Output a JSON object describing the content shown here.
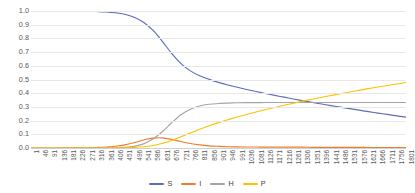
{
  "chart_data": {
    "type": "line",
    "title": "",
    "xlabel": "",
    "ylabel": "",
    "ylim": [
      0.0,
      1.0
    ],
    "ytick_labels": [
      "1.0",
      "0.9",
      "0.8",
      "0.7",
      "0.6",
      "0.5",
      "0.4",
      "0.3",
      "0.2",
      "0.1",
      "0.0"
    ],
    "ytick_values": [
      1.0,
      0.9,
      0.8,
      0.7,
      0.6,
      0.5,
      0.4,
      0.3,
      0.2,
      0.1,
      0.0
    ],
    "grid": true,
    "legend_position": "bottom",
    "xlim": [
      1,
      1801
    ],
    "x_tick_step": 45,
    "categories": [
      1,
      46,
      91,
      136,
      181,
      226,
      271,
      316,
      361,
      406,
      451,
      496,
      541,
      586,
      631,
      676,
      721,
      766,
      811,
      856,
      901,
      946,
      991,
      1036,
      1081,
      1126,
      1171,
      1216,
      1261,
      1306,
      1351,
      1396,
      1441,
      1486,
      1531,
      1576,
      1621,
      1666,
      1711,
      1756,
      1801
    ],
    "series": [
      {
        "name": "S",
        "color": "#5B6DB8",
        "values": [
          1.0,
          1.0,
          1.0,
          1.0,
          0.999,
          0.999,
          0.998,
          0.996,
          0.993,
          0.987,
          0.976,
          0.955,
          0.918,
          0.86,
          0.779,
          0.691,
          0.616,
          0.563,
          0.527,
          0.501,
          0.479,
          0.46,
          0.443,
          0.427,
          0.412,
          0.398,
          0.384,
          0.371,
          0.358,
          0.345,
          0.333,
          0.321,
          0.309,
          0.298,
          0.287,
          0.276,
          0.265,
          0.255,
          0.245,
          0.235,
          0.225
        ]
      },
      {
        "name": "I",
        "color": "#ED7D31",
        "values": [
          0.0,
          0.0,
          0.0,
          0.0,
          0.001,
          0.001,
          0.002,
          0.004,
          0.007,
          0.013,
          0.023,
          0.039,
          0.058,
          0.072,
          0.074,
          0.063,
          0.047,
          0.033,
          0.023,
          0.016,
          0.012,
          0.009,
          0.008,
          0.007,
          0.007,
          0.006,
          0.006,
          0.006,
          0.006,
          0.006,
          0.005,
          0.005,
          0.005,
          0.005,
          0.005,
          0.005,
          0.004,
          0.004,
          0.004,
          0.004,
          0.004
        ]
      },
      {
        "name": "H",
        "color": "#A5A5A5",
        "values": [
          0.0,
          0.0,
          0.0,
          0.0,
          0.0,
          0.0,
          0.0,
          0.0,
          0.001,
          0.002,
          0.005,
          0.012,
          0.03,
          0.065,
          0.119,
          0.184,
          0.243,
          0.283,
          0.307,
          0.319,
          0.325,
          0.328,
          0.33,
          0.331,
          0.331,
          0.332,
          0.332,
          0.332,
          0.332,
          0.332,
          0.332,
          0.332,
          0.332,
          0.332,
          0.332,
          0.332,
          0.332,
          0.332,
          0.332,
          0.332,
          0.332
        ]
      },
      {
        "name": "P",
        "color": "#FFC000",
        "values": [
          0.0,
          0.0,
          0.0,
          0.0,
          0.0,
          0.0,
          0.0,
          0.0,
          0.0,
          0.001,
          0.002,
          0.004,
          0.009,
          0.018,
          0.033,
          0.055,
          0.082,
          0.11,
          0.137,
          0.162,
          0.185,
          0.206,
          0.226,
          0.245,
          0.263,
          0.28,
          0.296,
          0.312,
          0.327,
          0.342,
          0.356,
          0.37,
          0.383,
          0.396,
          0.409,
          0.421,
          0.433,
          0.445,
          0.456,
          0.467,
          0.478
        ]
      }
    ]
  },
  "legend": {
    "items": [
      {
        "label": "S",
        "color": "#5B6DB8"
      },
      {
        "label": "I",
        "color": "#ED7D31"
      },
      {
        "label": "H",
        "color": "#A5A5A5"
      },
      {
        "label": "P",
        "color": "#FFC000"
      }
    ]
  }
}
